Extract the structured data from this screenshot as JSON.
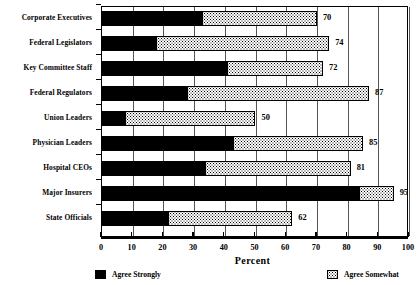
{
  "chart_data": {
    "type": "bar",
    "orientation": "horizontal",
    "stacked": true,
    "title": "",
    "xlabel": "Percent",
    "ylabel": "",
    "xlim": [
      0,
      100
    ],
    "xticks": [
      0,
      10,
      20,
      30,
      40,
      50,
      60,
      70,
      80,
      90,
      100
    ],
    "xtick_labels": [
      "0",
      "10",
      "20",
      "30",
      "40",
      "50",
      "60",
      "70",
      "80",
      "90",
      "100"
    ],
    "grid": true,
    "grid_axis": "x",
    "legend_position": "bottom",
    "categories": [
      "Corporate Executives",
      "Federal Legislators",
      "Key Committee Staff",
      "Federal Regulators",
      "Union Leaders",
      "Physician Leaders",
      "Hospital CEOs",
      "Major Insurers",
      "State Officials"
    ],
    "series": [
      {
        "name": "Agree Strongly",
        "color": "#000000",
        "values": [
          33,
          18,
          41,
          28,
          8,
          43,
          34,
          84,
          22
        ]
      },
      {
        "name": "Agree Somewhat",
        "color": "#ffffff",
        "values": [
          37,
          56,
          31,
          59,
          42,
          42,
          47,
          11,
          40
        ]
      }
    ],
    "totals": [
      70,
      74,
      72,
      87,
      50,
      85,
      81,
      95,
      62
    ],
    "total_labels": [
      "70",
      "74",
      "72",
      "87",
      "50",
      "85",
      "81",
      "95",
      "62"
    ]
  },
  "legend": {
    "items": [
      {
        "label": "Agree Strongly",
        "swatch": "solid-black-swatch"
      },
      {
        "label": "Agree Somewhat",
        "swatch": "dotted-white-swatch"
      }
    ]
  },
  "axis": {
    "x_title": "Percent"
  }
}
